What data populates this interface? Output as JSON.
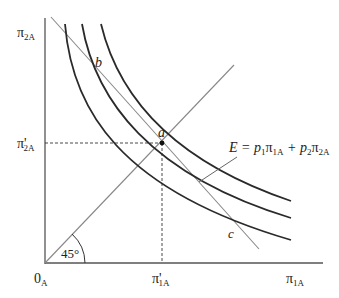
{
  "diagram": {
    "type": "indifference-curves-budget-line",
    "colors": {
      "axis": "#555555",
      "curve": "#2a2a2a",
      "line": "#888888",
      "dashed": "#333333",
      "text": "#222222"
    },
    "axes": {
      "x_label": {
        "main": "π",
        "sub": "1A"
      },
      "y_label": {
        "main": "π",
        "sub": "2A"
      },
      "origin": {
        "main": "0",
        "sub": "A"
      }
    },
    "ticks": {
      "x_tick": {
        "main": "π'",
        "sub": "1A"
      },
      "y_tick": {
        "main": "π'",
        "sub": "2A"
      }
    },
    "points": {
      "a": "a",
      "b": "b",
      "c": "c"
    },
    "angle_label": "45°",
    "equation": {
      "lhs": "E = p",
      "p1_sub": "1",
      "pi1": "π",
      "pi1_sub": "1A",
      "plus": " + p",
      "p2_sub": "2",
      "pi2": "π",
      "pi2_sub": "2A"
    },
    "curves_count": 3
  }
}
